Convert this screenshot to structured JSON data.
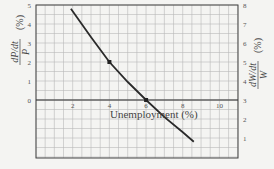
{
  "chart_data": {
    "type": "line",
    "title": "",
    "xlabel": "Unemployment (%)",
    "ylabel_left": "dP/dt / P (%)",
    "ylabel_right": "dW/dt / W (%)",
    "xlim": [
      0,
      11
    ],
    "ylim_left": [
      -3,
      5
    ],
    "ylim_right": [
      0,
      8
    ],
    "x_ticks": [
      "2",
      "4",
      "6",
      "8",
      "10"
    ],
    "y_ticks_left": [
      "0",
      "1",
      "2",
      "3",
      "4",
      "5"
    ],
    "y_ticks_right": [
      "1",
      "2",
      "3",
      "4",
      "5",
      "6",
      "7",
      "8"
    ],
    "grid": true,
    "series": [
      {
        "name": "Phillips curve",
        "x": [
          1.9,
          3,
          4,
          5,
          6,
          7,
          8,
          8.6
        ],
        "y": [
          4.8,
          3.3,
          2.0,
          0.95,
          0.0,
          -0.9,
          -1.7,
          -2.2
        ]
      }
    ],
    "markers": [
      {
        "x": 4,
        "y": 2
      },
      {
        "x": 6,
        "y": 0
      }
    ]
  }
}
